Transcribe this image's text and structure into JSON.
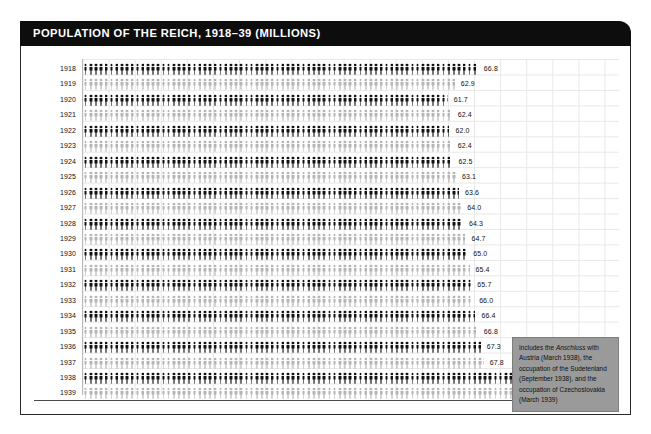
{
  "header": {
    "title": "POPULATION OF THE REICH, 1918–39 (MILLIONS)"
  },
  "annotation": {
    "part1": "Includes the ",
    "emphasis": "Anschluss",
    "part2": " with Austria (March 1938), the occupation of the Sudetenland (September 1938), and the occupation of Czechoslovakia (March 1939)"
  },
  "colors": {
    "header_background": "#0d0d0d",
    "header_text": "#ffffff",
    "bar_dark": "#111111",
    "bar_light": "#b5b5b5",
    "annotation_background": "#9a9a9a",
    "grid": "#e8e8e8",
    "baseline": "#4a4a4a",
    "page_background": "#ffffff"
  },
  "chart_data": {
    "type": "bar",
    "orientation": "horizontal",
    "title": "POPULATION OF THE REICH, 1918–39 (MILLIONS)",
    "xlabel": "",
    "ylabel": "",
    "unit": "millions",
    "xlim": [
      0,
      90
    ],
    "grid": true,
    "legend": "none",
    "pictogram": "human-figure",
    "categories": [
      "1918",
      "1919",
      "1920",
      "1921",
      "1922",
      "1923",
      "1924",
      "1925",
      "1926",
      "1927",
      "1928",
      "1929",
      "1930",
      "1931",
      "1932",
      "1933",
      "1934",
      "1935",
      "1936",
      "1937",
      "1938",
      "1939"
    ],
    "values": [
      66.8,
      62.9,
      61.7,
      62.4,
      62.0,
      62.4,
      62.5,
      63.1,
      63.6,
      64.0,
      64.3,
      64.7,
      65.0,
      65.4,
      65.7,
      66.0,
      66.4,
      66.8,
      67.3,
      67.8,
      75.3,
      86.9
    ],
    "labels": [
      "66.8",
      "62.9",
      "61.7",
      "62.4",
      "62.0",
      "62.4",
      "62.5",
      "63.1",
      "63.6",
      "64.0",
      "64.3",
      "64.7",
      "65.0",
      "65.4",
      "65.7",
      "66.0",
      "66.4",
      "66.8",
      "67.3",
      "67.8",
      "75.3",
      "86.9"
    ],
    "bar_styles": [
      "dark",
      "light",
      "dark",
      "light",
      "dark",
      "light",
      "dark",
      "light",
      "dark",
      "light",
      "dark",
      "light",
      "dark",
      "light",
      "dark",
      "light",
      "dark",
      "light",
      "dark",
      "light",
      "dark",
      "light"
    ]
  }
}
